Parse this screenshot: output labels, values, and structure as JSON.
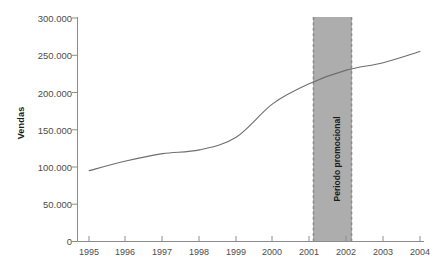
{
  "chart_data": {
    "type": "line",
    "title": "",
    "xlabel": "",
    "ylabel": "Vendas",
    "x": [
      1995,
      1996,
      1997,
      1998,
      1999,
      2000,
      2001,
      2002,
      2003,
      2004
    ],
    "values": [
      95000,
      108000,
      118000,
      123000,
      140000,
      185000,
      212000,
      230000,
      240000,
      255000
    ],
    "series": [
      {
        "name": "Vendas",
        "values": [
          95000,
          108000,
          118000,
          123000,
          140000,
          185000,
          212000,
          230000,
          240000,
          255000
        ]
      }
    ],
    "xlim": [
      1995,
      2004
    ],
    "ylim": [
      0,
      300000
    ],
    "ytick_labels": [
      "0",
      "50.000",
      "100.000",
      "150.000",
      "200.000",
      "250.000",
      "300.000"
    ],
    "ytick_values": [
      0,
      50000,
      100000,
      150000,
      200000,
      250000,
      300000
    ],
    "xtick_labels": [
      "1995",
      "1996",
      "1997",
      "1998",
      "1999",
      "2000",
      "2001",
      "2002",
      "2003",
      "2004"
    ],
    "grid": false,
    "legend": "none",
    "annotations": [
      {
        "text": "Periodo promocional",
        "type": "vertical-span",
        "x_start": 2001.2,
        "x_end": 2002.3,
        "fill": "#adadad",
        "border_style": "dashed"
      }
    ],
    "line_color": "#6e6e6e",
    "axis_color": "#8c8c8c"
  }
}
